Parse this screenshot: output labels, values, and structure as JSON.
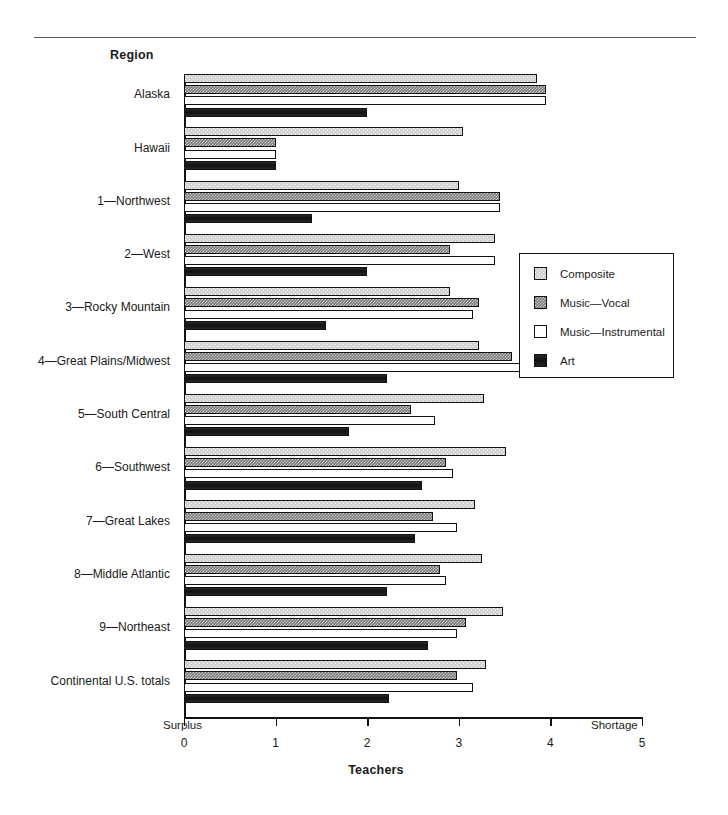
{
  "chart_data": {
    "type": "bar",
    "orientation": "horizontal",
    "title": "",
    "xlabel": "Teachers",
    "ylabel": "Region",
    "xlim": [
      0,
      5
    ],
    "xticks": [
      0,
      1,
      2,
      3,
      4,
      5
    ],
    "xtick_labels": [
      "0",
      "1",
      "2",
      "3",
      "4",
      "5"
    ],
    "axis_end_labels": {
      "low": "Surplus",
      "high": "Shortage"
    },
    "grid": false,
    "legend_position": "center-right",
    "categories": [
      "Alaska",
      "Hawaii",
      "1—Northwest",
      "2—West",
      "3—Rocky Mountain",
      "4—Great Plains/Midwest",
      "5—South Central",
      "6—Southwest",
      "7—Great Lakes",
      "8—Middle Atlantic",
      "9—Northeast",
      "Continental U.S. totals"
    ],
    "series": [
      {
        "name": "Composite",
        "fill": "light-stipple",
        "values": [
          3.85,
          3.05,
          3.0,
          3.4,
          2.9,
          3.22,
          3.28,
          3.52,
          3.18,
          3.25,
          3.48,
          3.3
        ]
      },
      {
        "name": "Music—Vocal",
        "fill": "dark-checker",
        "values": [
          3.95,
          1.0,
          3.45,
          2.9,
          3.22,
          3.58,
          2.48,
          2.86,
          2.72,
          2.8,
          3.08,
          2.98
        ]
      },
      {
        "name": "Music—Instrumental",
        "fill": "white",
        "values": [
          3.95,
          1.0,
          3.45,
          3.4,
          3.15,
          3.72,
          2.74,
          2.94,
          2.98,
          2.86,
          2.98,
          3.16
        ]
      },
      {
        "name": "Art",
        "fill": "solid-black",
        "values": [
          2.0,
          1.0,
          1.4,
          2.0,
          1.55,
          2.22,
          1.8,
          2.6,
          2.52,
          2.22,
          2.66,
          2.24
        ]
      }
    ]
  },
  "legend": {
    "items": [
      {
        "label": "Composite"
      },
      {
        "label": "Music—Vocal"
      },
      {
        "label": "Music—Instrumental"
      },
      {
        "label": "Art"
      }
    ]
  },
  "colors": {
    "axis": "#111111",
    "composite": "#d2d2d2",
    "vocal": "#6f6f6f",
    "instrumental": "#ffffff",
    "art": "#161616",
    "rule": "#555555"
  }
}
